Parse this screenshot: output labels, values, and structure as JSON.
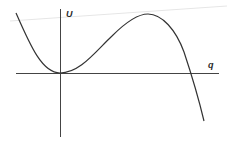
{
  "diagram": {
    "type": "potential-energy-curve",
    "axes": {
      "x_label": "q",
      "y_label": "U"
    },
    "curve": {
      "description": "Potential energy U(q): local minimum at origin, local maximum at positive q, then drops below axis",
      "points": [
        [
          16,
          13
        ],
        [
          30,
          40
        ],
        [
          45,
          62
        ],
        [
          60,
          73
        ],
        [
          75,
          71
        ],
        [
          95,
          58
        ],
        [
          115,
          36
        ],
        [
          135,
          18
        ],
        [
          148,
          14
        ],
        [
          162,
          20
        ],
        [
          178,
          45
        ],
        [
          190,
          73
        ],
        [
          198,
          98
        ],
        [
          204,
          121
        ]
      ]
    },
    "colors": {
      "curve": "#333333",
      "axes": "#444444",
      "faint_line": "#e4e4e4"
    }
  }
}
